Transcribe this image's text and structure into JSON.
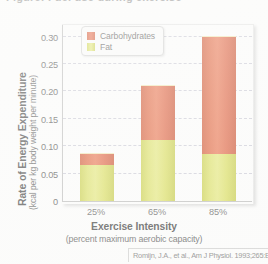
{
  "top_crop_text": "Figure: Fuel use during exercise",
  "chart_data": {
    "type": "bar",
    "subtype": "stacked",
    "title": "",
    "xlabel": "Exercise Intensity",
    "xlabel_sub": "(percent maximum aerobic capacity)",
    "ylabel": "Rate of Energy Expenditure",
    "ylabel_sub": "(kcal per kg body weight per minute)",
    "categories": [
      "25%",
      "65%",
      "85%"
    ],
    "series": [
      {
        "name": "Fat",
        "color": "#D9DD52",
        "values": [
          0.065,
          0.112,
          0.085
        ]
      },
      {
        "name": "Carbohydrates",
        "color": "#DE5631",
        "values": [
          0.02,
          0.098,
          0.215
        ]
      }
    ],
    "totals": [
      0.085,
      0.21,
      0.3
    ],
    "ylim": [
      0,
      0.325
    ],
    "yticks": [
      0,
      0.05,
      0.1,
      0.15,
      0.2,
      0.25,
      0.3
    ],
    "ytick_labels": [
      "0",
      "0.05",
      "0.10",
      "0.15",
      "0.20",
      "0.25",
      "0.30"
    ],
    "grid": "horizontal-dashed",
    "legend_position": "top-left-inside",
    "stack_order_bottom_to_top": [
      "Fat",
      "Carbohydrates"
    ]
  },
  "legend": {
    "items": [
      {
        "label": "Carbohydrates",
        "swatch": "carb"
      },
      {
        "label": "Fat",
        "swatch": "fat"
      }
    ]
  },
  "source": {
    "citation": "Romijn, J.A., et al., Am J Physiol. 1993;265:E380–91."
  },
  "colors": {
    "carbohydrates": "#DE5631",
    "fat": "#D9DD52",
    "gridline": "#C9C9D6",
    "axis": "#B9B9B9",
    "text": "#3A3A3A"
  }
}
